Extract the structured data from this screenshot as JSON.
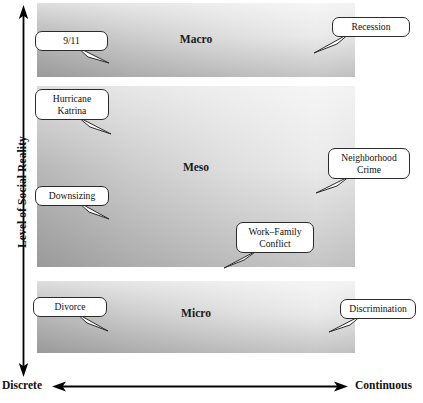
{
  "diagram": {
    "title_present": false,
    "axes": {
      "y": {
        "label": "Level of Social Reality",
        "arrow": "double-headed-vertical",
        "direction_hint": "up increases"
      },
      "x": {
        "left_label": "Discrete",
        "right_label": "Continuous",
        "arrow": "double-headed-horizontal"
      }
    },
    "bands": [
      {
        "id": "macro",
        "label": "Macro"
      },
      {
        "id": "meso",
        "label": "Meso"
      },
      {
        "id": "micro",
        "label": "Micro"
      }
    ],
    "callouts": [
      {
        "id": "nine-eleven",
        "band": "macro",
        "side": "left",
        "text": "9/11",
        "line1": "9/11",
        "line2": ""
      },
      {
        "id": "recession",
        "band": "macro",
        "side": "right",
        "text": "Recession",
        "line1": "Recession",
        "line2": ""
      },
      {
        "id": "katrina",
        "band": "meso",
        "side": "left",
        "text": "Hurricane Katrina",
        "line1": "Hurricane",
        "line2": "Katrina"
      },
      {
        "id": "downsizing",
        "band": "meso",
        "side": "left",
        "text": "Downsizing",
        "line1": "Downsizing",
        "line2": ""
      },
      {
        "id": "neighborhood-crime",
        "band": "meso",
        "side": "right",
        "text": "Neighborhood Crime",
        "line1": "Neighborhood",
        "line2": "Crime"
      },
      {
        "id": "work-family-conflict",
        "band": "meso",
        "side": "center-right",
        "text": "Work–Family Conflict",
        "line1": "Work–Family",
        "line2": "Conflict"
      },
      {
        "id": "divorce",
        "band": "micro",
        "side": "left",
        "text": "Divorce",
        "line1": "Divorce",
        "line2": ""
      },
      {
        "id": "discrimination",
        "band": "micro",
        "side": "right",
        "text": "Discrimination",
        "line1": "Discrimination",
        "line2": ""
      }
    ],
    "colors": {
      "band_dark": "#a8a8a8",
      "band_light": "#e6e6e6",
      "stroke": "#2b2b2b",
      "text": "#111111",
      "background": "#ffffff"
    }
  }
}
